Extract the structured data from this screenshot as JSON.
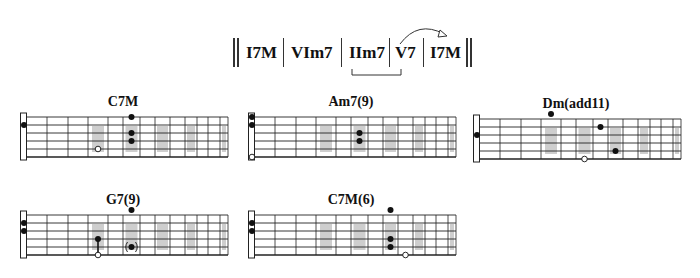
{
  "progression": {
    "items": [
      {
        "label": "I7M",
        "x": 246
      },
      {
        "label": "VIm7",
        "x": 291
      },
      {
        "label": "IIm7",
        "x": 349
      },
      {
        "label": "V7",
        "x": 395
      },
      {
        "label": "I7M",
        "x": 430
      }
    ],
    "bars": [
      283,
      341,
      389,
      423
    ],
    "double_bar_start": [
      233,
      237
    ],
    "double_bar_end": [
      466,
      470
    ],
    "bracket": {
      "from_label": "IIm7",
      "to_label": "V7"
    },
    "arrow": {
      "from_label": "V7",
      "to_label": "I7M"
    }
  },
  "fretboard": {
    "fret_offsets": [
      7,
      27,
      48,
      68,
      88,
      103,
      120,
      135,
      150,
      165,
      177,
      188,
      200,
      208
    ],
    "string_count": 6,
    "string_spacing": 8,
    "inlay_frets": [
      3,
      5,
      7,
      9,
      12
    ],
    "colors": {
      "line": "#222222",
      "inlay": "#bdbdbd",
      "dot": "#111111",
      "nut": "#ffffff"
    }
  },
  "chords": [
    {
      "name": "C7M",
      "x": 20,
      "y": 116,
      "nut_dots": [
        {
          "string": 2,
          "type": "filled"
        }
      ],
      "dots": [
        {
          "fret": 5,
          "string": 1,
          "type": "filled"
        },
        {
          "fret": 5,
          "string": 3,
          "type": "filled"
        },
        {
          "fret": 5,
          "string": 4,
          "type": "filled"
        },
        {
          "fret": 3,
          "string": 5,
          "type": "open"
        }
      ]
    },
    {
      "name": "Am7(9)",
      "x": 248,
      "y": 116,
      "nut_dots": [
        {
          "string": 1,
          "type": "filled"
        },
        {
          "string": 2,
          "type": "filled"
        },
        {
          "string": 6,
          "type": "open"
        }
      ],
      "dots": [
        {
          "fret": 5,
          "string": 3,
          "type": "filled"
        },
        {
          "fret": 5,
          "string": 4,
          "type": "filled"
        }
      ]
    },
    {
      "name": "Dm(add11)",
      "x": 473,
      "y": 118,
      "nut_dots": [
        {
          "string": 3,
          "type": "filled"
        }
      ],
      "dots": [
        {
          "fret": 3,
          "string": 0,
          "type": "filled"
        },
        {
          "fret": 6,
          "string": 2,
          "type": "filled"
        },
        {
          "fret": 7,
          "string": 5,
          "type": "filled"
        },
        {
          "fret": 5,
          "string": 6,
          "type": "open"
        }
      ]
    },
    {
      "name": "G7(9)",
      "x": 20,
      "y": 214,
      "nut_dots": [
        {
          "string": 2,
          "type": "filled"
        },
        {
          "string": 3,
          "type": "filled"
        }
      ],
      "dots": [
        {
          "fret": 5,
          "string": 0,
          "type": "filled"
        },
        {
          "fret": 3,
          "string": 4,
          "type": "filled"
        },
        {
          "fret": 3,
          "string": 6,
          "type": "open"
        },
        {
          "fret": 5,
          "string": 5,
          "type": "optional"
        }
      ],
      "barre_lines": [
        {
          "fret": 3,
          "from": 4,
          "to": 6
        }
      ]
    },
    {
      "name": "C7M(6)",
      "x": 248,
      "y": 214,
      "nut_dots": [
        {
          "string": 2,
          "type": "filled"
        },
        {
          "string": 3,
          "type": "filled"
        }
      ],
      "dots": [
        {
          "fret": 7,
          "string": 0,
          "type": "filled"
        },
        {
          "fret": 7,
          "string": 4,
          "type": "filled"
        },
        {
          "fret": 7,
          "string": 5,
          "type": "filled"
        },
        {
          "fret": 8,
          "string": 6,
          "type": "open"
        }
      ]
    }
  ]
}
